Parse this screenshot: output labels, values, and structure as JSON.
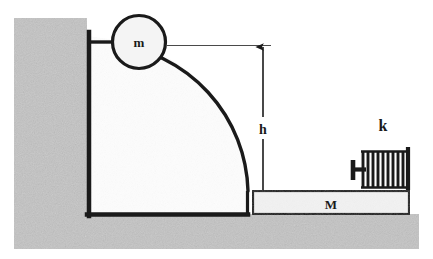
{
  "figure": {
    "type": "physics-mechanics-diagram",
    "width": 433,
    "height": 259
  },
  "labels": {
    "mass_ball": "m",
    "height": "h",
    "block": "M",
    "spring_constant": "k"
  },
  "colors": {
    "ground": "#c3c3c3",
    "wall": "#c3c3c3",
    "ramp_fill": "#fdfdfd",
    "block_fill": "#f2f2f2",
    "ball_fill": "#f4f4f4",
    "stroke": "#1a1a1a",
    "thin_line": "#4a4a4a",
    "background": "#ffffff"
  },
  "elements": {
    "ground": {
      "name": "ground",
      "x": 14,
      "y": 214,
      "width": 405,
      "height": 35
    },
    "wall": {
      "name": "left-wall",
      "x": 14,
      "y": 18,
      "width": 73,
      "height": 196
    },
    "ramp": {
      "name": "curved-ramp",
      "left": 87,
      "top": 36,
      "bottom": 214,
      "right": 248,
      "curve": "quarter-circle"
    },
    "ball": {
      "name": "ball-m",
      "cx": 139,
      "cy": 42,
      "r": 27
    },
    "height_dimension": {
      "name": "height-dimension",
      "x": 263,
      "top": 45,
      "bottom": 192,
      "arrow": "up",
      "leader_from_x": 166,
      "leader_y": 45
    },
    "block": {
      "name": "block-M",
      "x": 252,
      "y": 190,
      "width": 158,
      "height": 24
    },
    "spring": {
      "name": "spring-k",
      "coil_count": 10,
      "left": 352,
      "right": 410,
      "top": 148,
      "bottom": 188,
      "anchor_x": 408,
      "plunger_x": 354
    }
  }
}
